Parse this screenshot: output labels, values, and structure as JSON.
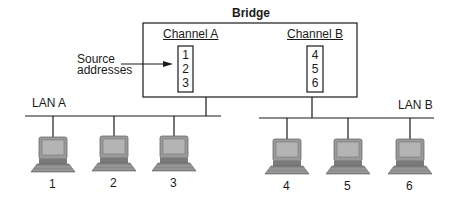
{
  "bridge": {
    "title": "Bridge",
    "channels": [
      {
        "label": "Channel A",
        "addresses": [
          "1",
          "2",
          "3"
        ]
      },
      {
        "label": "Channel B",
        "addresses": [
          "4",
          "5",
          "6"
        ]
      }
    ]
  },
  "annotation": {
    "label_line1": "Source",
    "label_line2": "addresses"
  },
  "lans": [
    {
      "label": "LAN A",
      "computers": [
        "1",
        "2",
        "3"
      ]
    },
    {
      "label": "LAN B",
      "computers": [
        "4",
        "5",
        "6"
      ]
    }
  ],
  "colors": {
    "line": "#1a1a1a",
    "computer_body": "#8a8a8a",
    "computer_screen": "#a8a8a8",
    "computer_dark": "#5a5a5a"
  }
}
